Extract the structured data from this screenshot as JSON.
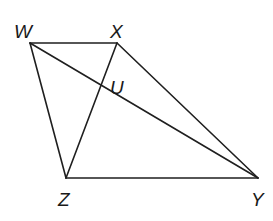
{
  "diagram": {
    "points": {
      "W": {
        "label": "W",
        "x": 30,
        "y": 43,
        "lx": 14,
        "ly": 38
      },
      "X": {
        "label": "X",
        "x": 117,
        "y": 43,
        "lx": 110,
        "ly": 38
      },
      "U": {
        "label": "U",
        "x": 101,
        "y": 102,
        "lx": 110,
        "ly": 97
      },
      "Z": {
        "label": "Z",
        "x": 66,
        "y": 178,
        "lx": 58,
        "ly": 206
      },
      "Y": {
        "label": "Y",
        "x": 258,
        "y": 178,
        "lx": 251,
        "ly": 206
      }
    },
    "segments": [
      "WX",
      "WZ",
      "WY",
      "XZ",
      "XY",
      "ZY"
    ],
    "colors": {
      "stroke": "#1f1f1f",
      "background": "#ffffff"
    }
  }
}
